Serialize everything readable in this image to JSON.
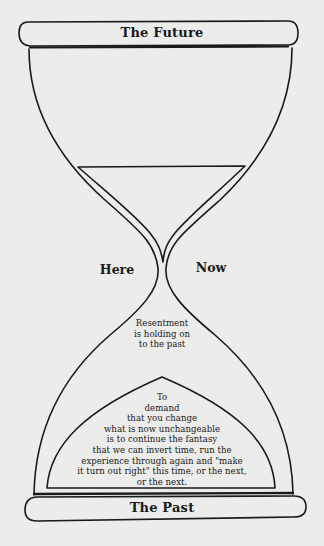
{
  "diagram": {
    "type": "hourglass",
    "top_band": {
      "label": "The Future"
    },
    "bottom_band": {
      "label": "The Past"
    },
    "neck_labels": {
      "left": "Here",
      "right": "Now"
    },
    "lower_chamber_caption": {
      "lines": [
        "Resentment",
        "is holding on",
        "to the past"
      ]
    },
    "sand_pile_text": {
      "lines": [
        "To",
        "demand",
        "that you change",
        "what is now unchangeable",
        "is to continue the fantasy",
        "that we can invert time, run the",
        "experience through again and \"make",
        "it turn out right\" this time, or the next,",
        "or the next."
      ]
    },
    "colors": {
      "background": "#ececea",
      "ink": "#1a1a1a"
    }
  }
}
